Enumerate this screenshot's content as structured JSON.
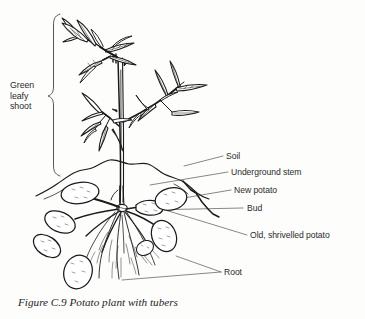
{
  "figure": {
    "caption": "Figure C.9 Potato plant with tubers",
    "background_color": "#fdfdfc",
    "ink_color": "#1a1a1a",
    "label_color": "#2b2b2b",
    "leader_color": "#555555"
  },
  "bracket_label": {
    "line1": "Green",
    "line2": "leafy",
    "line3": "shoot",
    "full_text": "Green leafy shoot"
  },
  "labels": {
    "soil": "Soil",
    "underground_stem": "Underground stem",
    "new_potato": "New potato",
    "bud": "Bud",
    "old_potato": "Old, shrivelled potato",
    "root": "Root"
  },
  "parts": [
    {
      "name": "green-leafy-shoot",
      "label": "Green leafy shoot"
    },
    {
      "name": "soil",
      "label": "Soil"
    },
    {
      "name": "underground-stem",
      "label": "Underground stem"
    },
    {
      "name": "new-potato",
      "label": "New potato"
    },
    {
      "name": "bud",
      "label": "Bud"
    },
    {
      "name": "old-shrivelled-potato",
      "label": "Old, shrivelled potato"
    },
    {
      "name": "root",
      "label": "Root"
    }
  ]
}
